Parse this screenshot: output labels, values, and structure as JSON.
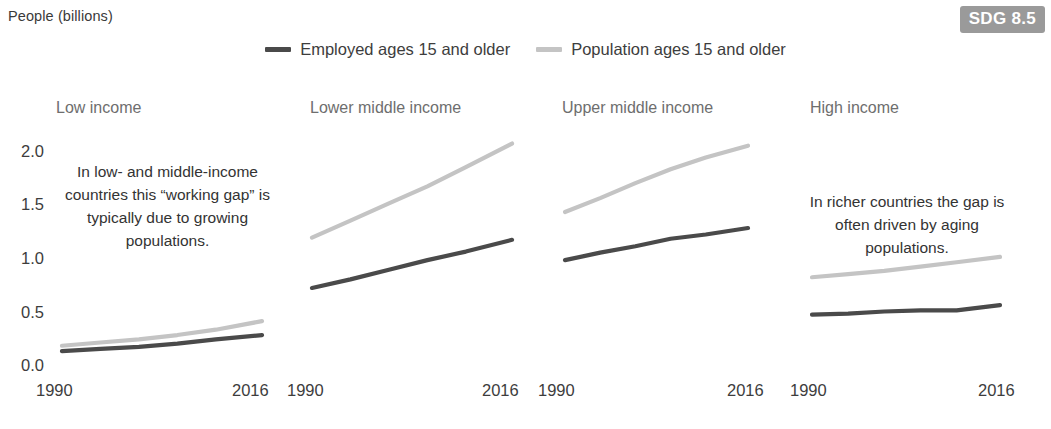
{
  "header": {
    "axis_label": "People (billions)",
    "badge": "SDG 8.5",
    "badge_color": "#9a9a9a"
  },
  "legend": {
    "items": [
      {
        "label": "Employed ages 15 and older",
        "color": "#4a4a4a",
        "key": "employed"
      },
      {
        "label": "Population ages 15 and older",
        "color": "#c4c4c4",
        "key": "population"
      }
    ]
  },
  "y_axis": {
    "ticks": [
      "2.0",
      "1.5",
      "1.0",
      "0.5",
      "0.0"
    ]
  },
  "panels": [
    {
      "title": "Low income",
      "x_start": "1990",
      "x_end": "2016",
      "annotation": "In low- and middle-income countries this “working gap” is typically due to growing populations."
    },
    {
      "title": "Lower middle income",
      "x_start": "1990",
      "x_end": "2016",
      "annotation": ""
    },
    {
      "title": "Upper middle income",
      "x_start": "1990",
      "x_end": "2016",
      "annotation": ""
    },
    {
      "title": "High income",
      "x_start": "1990",
      "x_end": "2016",
      "annotation": "In richer countries the gap is often driven by aging populations."
    }
  ],
  "chart_data": {
    "type": "line",
    "title": "",
    "subtitle": "",
    "xlabel": "",
    "ylabel": "People (billions)",
    "ylim": [
      0.0,
      2.2
    ],
    "yticks": [
      0.0,
      0.5,
      1.0,
      1.5,
      2.0
    ],
    "xlim": [
      1990,
      2016
    ],
    "xticks": [
      1990,
      2016
    ],
    "grid": false,
    "legend_position": "top-center",
    "panel_layout": "1x4 small multiples, shared y axis",
    "panels": [
      {
        "name": "Low income",
        "x": [
          1990,
          1995,
          2000,
          2005,
          2010,
          2016
        ],
        "series": [
          {
            "name": "Employed ages 15 and older",
            "color": "#4a4a4a",
            "values": [
              0.13,
              0.15,
              0.17,
              0.2,
              0.24,
              0.28
            ]
          },
          {
            "name": "Population ages 15 and older",
            "color": "#c4c4c4",
            "values": [
              0.18,
              0.21,
              0.24,
              0.28,
              0.33,
              0.41
            ]
          }
        ]
      },
      {
        "name": "Lower middle income",
        "x": [
          1990,
          1995,
          2000,
          2005,
          2010,
          2016
        ],
        "series": [
          {
            "name": "Employed ages 15 and older",
            "color": "#4a4a4a",
            "values": [
              0.72,
              0.8,
              0.89,
              0.98,
              1.06,
              1.17
            ]
          },
          {
            "name": "Population ages 15 and older",
            "color": "#c4c4c4",
            "values": [
              1.19,
              1.35,
              1.51,
              1.67,
              1.85,
              2.07
            ]
          }
        ]
      },
      {
        "name": "Upper middle income",
        "x": [
          1990,
          1995,
          2000,
          2005,
          2010,
          2016
        ],
        "series": [
          {
            "name": "Employed ages 15 and older",
            "color": "#4a4a4a",
            "values": [
              0.98,
              1.05,
              1.11,
              1.18,
              1.22,
              1.28
            ]
          },
          {
            "name": "Population ages 15 and older",
            "color": "#c4c4c4",
            "values": [
              1.43,
              1.56,
              1.7,
              1.83,
              1.94,
              2.05
            ]
          }
        ]
      },
      {
        "name": "High income",
        "x": [
          1990,
          1995,
          2000,
          2005,
          2010,
          2016
        ],
        "series": [
          {
            "name": "Employed ages 15 and older",
            "color": "#4a4a4a",
            "values": [
              0.47,
              0.48,
              0.5,
              0.51,
              0.51,
              0.56
            ]
          },
          {
            "name": "Population ages 15 and older",
            "color": "#c4c4c4",
            "values": [
              0.82,
              0.85,
              0.88,
              0.92,
              0.96,
              1.01
            ]
          }
        ]
      }
    ]
  },
  "geometry": {
    "panel_x_ranges": [
      [
        62,
        262
      ],
      [
        312,
        512
      ],
      [
        565,
        748
      ],
      [
        812,
        1000
      ]
    ],
    "y_pixel_top": 151,
    "y_pixel_bottom": 365,
    "y_value_top": 2.0,
    "y_value_bottom": 0.0,
    "title_x": [
      56,
      310,
      562,
      810
    ],
    "title_y": 99,
    "xtick_start_x": [
      36,
      287,
      538,
      790
    ],
    "xtick_end_x": [
      232,
      482,
      727,
      978
    ]
  }
}
